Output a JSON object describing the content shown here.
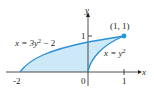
{
  "diagram": {
    "axes": {
      "x_label": "x",
      "y_label": "y",
      "x_ticks": [
        "-2",
        "0",
        "1"
      ],
      "y_ticks": [
        "1"
      ]
    },
    "curves": [
      {
        "name": "left",
        "equation_lhs": "x = 3y",
        "exp": "2",
        "equation_rhs": " − 2"
      },
      {
        "name": "right",
        "equation_lhs": "x = y",
        "exp": "2",
        "equation_rhs": ""
      }
    ],
    "point": {
      "label": "(1, 1)"
    },
    "colors": {
      "curve": "#2a8fd6",
      "fill": "#cde8f7",
      "point": "#1e9be0",
      "axis": "#231f20"
    }
  }
}
